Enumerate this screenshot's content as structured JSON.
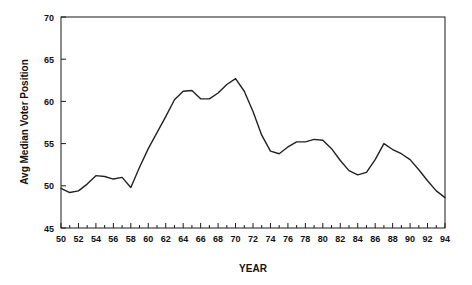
{
  "chart_data": {
    "type": "line",
    "title": "",
    "xlabel": "YEAR",
    "ylabel": "Avg Median Voter Position",
    "xlim": [
      50,
      94
    ],
    "ylim": [
      45,
      70
    ],
    "grid": false,
    "legend": "none",
    "x_major_step": 2,
    "x_minor_step": 1,
    "y_major_step": 5,
    "x_tick_labels": [
      "50",
      "52",
      "54",
      "56",
      "58",
      "60",
      "62",
      "64",
      "66",
      "68",
      "70",
      "72",
      "74",
      "76",
      "78",
      "80",
      "82",
      "84",
      "86",
      "88",
      "90",
      "92",
      "94"
    ],
    "y_tick_labels": [
      "45",
      "50",
      "55",
      "60",
      "65",
      "70"
    ],
    "series": [
      {
        "name": "Avg Median Voter Position",
        "x": [
          50,
          51,
          52,
          53,
          54,
          55,
          56,
          57,
          58,
          59,
          60,
          61,
          62,
          63,
          64,
          65,
          66,
          67,
          68,
          69,
          70,
          71,
          72,
          73,
          74,
          75,
          76,
          77,
          78,
          79,
          80,
          81,
          82,
          83,
          84,
          85,
          86,
          87,
          88,
          89,
          90,
          91,
          92,
          93,
          94
        ],
        "values": [
          49.7,
          49.2,
          49.4,
          50.2,
          51.2,
          51.1,
          50.8,
          51.0,
          49.8,
          52.2,
          54.4,
          56.3,
          58.2,
          60.2,
          61.2,
          61.3,
          60.3,
          60.3,
          61.0,
          62.0,
          62.7,
          61.2,
          58.8,
          56.0,
          54.1,
          53.8,
          54.6,
          55.2,
          55.2,
          55.5,
          55.4,
          54.4,
          53.0,
          51.8,
          51.3,
          51.6,
          53.1,
          55.0,
          54.3,
          53.8,
          53.1,
          51.9,
          50.6,
          49.4,
          48.6
        ]
      }
    ]
  },
  "axes": {
    "y_title": "Avg Median Voter Position",
    "x_title": "YEAR"
  }
}
